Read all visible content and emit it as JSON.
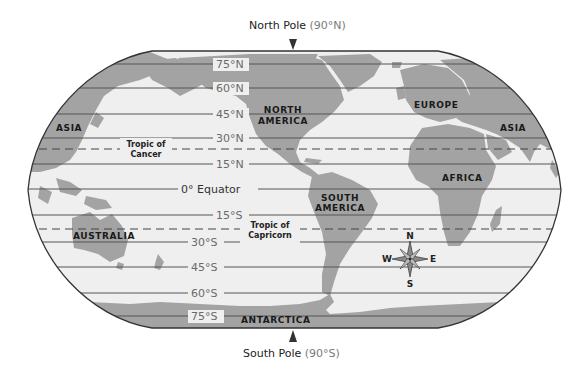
{
  "map": {
    "title": "World Map with Latitude Lines",
    "north_pole": {
      "label": "North Pole",
      "coord": "(90°N)"
    },
    "south_pole": {
      "label": "South Pole",
      "coord": "(90°S)"
    },
    "latitudes": [
      {
        "label": "75°N",
        "y": 64
      },
      {
        "label": "60°N",
        "y": 88
      },
      {
        "label": "45°N",
        "y": 114
      },
      {
        "label": "30°N",
        "y": 138
      },
      {
        "label": "15°N",
        "y": 164
      },
      {
        "label": "0° Equator",
        "y": 189
      },
      {
        "label": "15°S",
        "y": 215
      },
      {
        "label": "30°S",
        "y": 242
      },
      {
        "label": "45°S",
        "y": 267
      },
      {
        "label": "60°S",
        "y": 293
      },
      {
        "label": "75°S",
        "y": 316
      }
    ],
    "tropics": {
      "cancer": {
        "line1": "Tropic of",
        "line2": "Cancer",
        "y": 149
      },
      "capricorn": {
        "line1": "Tropic of",
        "line2": "Capricorn",
        "y": 229
      }
    },
    "continents": {
      "asia_west": "ASIA",
      "asia_east": "ASIA",
      "north_america_1": "NORTH",
      "north_america_2": "AMERICA",
      "south_america_1": "SOUTH",
      "south_america_2": "AMERICA",
      "europe": "EUROPE",
      "africa": "AFRICA",
      "australia": "AUSTRALIA",
      "antarctica": "ANTARCTICA"
    },
    "compass": {
      "n": "N",
      "s": "S",
      "e": "E",
      "w": "W"
    },
    "colors": {
      "ocean": "#efefef",
      "land": "#a3a3a3",
      "grid": "#555555",
      "border": "#333333",
      "pole_marker": "#333333"
    }
  }
}
